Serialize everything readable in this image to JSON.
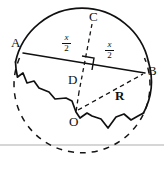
{
  "figure": {
    "type": "geometry-diagram",
    "background_color": "#ffffff",
    "stroke_color": "#101010",
    "baseline_color": "#c8c8c8",
    "points": [
      {
        "id": "A",
        "label": "A",
        "x": 17,
        "y": 44
      },
      {
        "id": "B",
        "label": "B",
        "x": 146,
        "y": 71
      },
      {
        "id": "C",
        "label": "C",
        "x": 95,
        "y": 17
      },
      {
        "id": "D",
        "label": "D",
        "x": 76,
        "y": 81
      },
      {
        "id": "O",
        "label": "O",
        "x": 74,
        "y": 119
      }
    ],
    "segments": [
      {
        "id": "chord-AD",
        "label": "x/2",
        "numerator": "x",
        "denominator": "2"
      },
      {
        "id": "chord-DB",
        "label": "x/2",
        "numerator": "x",
        "denominator": "2"
      },
      {
        "id": "radius-OB",
        "label": "R"
      }
    ],
    "labels": {
      "A": "A",
      "B": "B",
      "C": "C",
      "D": "D",
      "O": "O",
      "R": "R",
      "half_chord_numerator": "x",
      "half_chord_denominator": "2"
    },
    "marks": {
      "right_angle_at": "D"
    },
    "circle": {
      "center_x": 82,
      "center_y": 92,
      "radius": 68,
      "solid_arc": "upper",
      "dashed_arc": "lower"
    },
    "baseline": {
      "y": 145
    }
  }
}
